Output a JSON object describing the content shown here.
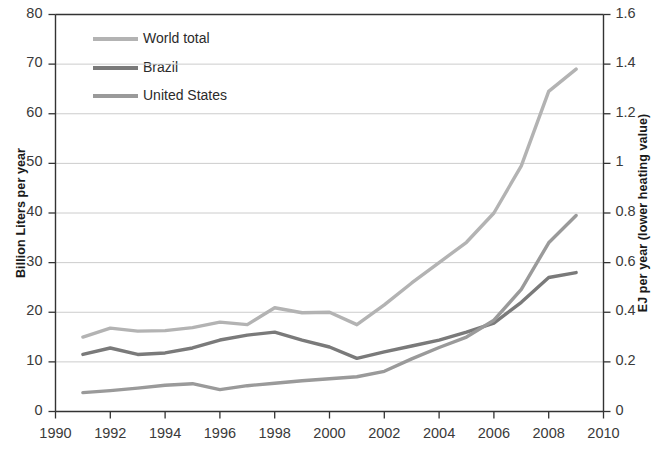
{
  "chart_data": {
    "type": "line",
    "title": "",
    "xlabel": "",
    "ylabel": "Billion Liters per year",
    "y2label": "EJ per year (lower heating value)",
    "x": [
      1991,
      1992,
      1993,
      1994,
      1995,
      1996,
      1997,
      1998,
      1999,
      2000,
      2001,
      2002,
      2003,
      2004,
      2005,
      2006,
      2007,
      2008,
      2009
    ],
    "xlim": [
      1990,
      2010
    ],
    "ylim": [
      0,
      80
    ],
    "y2lim": [
      0,
      1.6
    ],
    "xticks": [
      1990,
      1992,
      1994,
      1996,
      1998,
      2000,
      2002,
      2004,
      2006,
      2008,
      2010
    ],
    "yticks": [
      0,
      10,
      20,
      30,
      40,
      50,
      60,
      70,
      80
    ],
    "y2ticks": [
      0,
      0.2,
      0.4,
      0.6,
      0.8,
      1,
      1.2,
      1.4,
      1.6
    ],
    "xtick_labels": [
      "1990",
      "1992",
      "1994",
      "1996",
      "1998",
      "2000",
      "2002",
      "2004",
      "2006",
      "2008",
      "2010"
    ],
    "ytick_labels": [
      "0",
      "10",
      "20",
      "30",
      "40",
      "50",
      "60",
      "70",
      "80"
    ],
    "y2tick_labels": [
      "0",
      "0.2",
      "0.4",
      "0.6",
      "0.8",
      "1",
      "1.2",
      "1.4",
      "1.6"
    ],
    "grid": true,
    "grid_axis": "y",
    "legend_position": "top-left",
    "series": [
      {
        "name": "World total",
        "color": "#b3b3b3",
        "values": [
          15.0,
          16.8,
          16.2,
          16.3,
          16.9,
          18.0,
          17.5,
          20.9,
          19.9,
          20.0,
          17.5,
          21.5,
          25.9,
          30.0,
          34.1,
          40.0,
          49.5,
          64.5,
          69.0
        ]
      },
      {
        "name": "Brazil",
        "color": "#7a7a7a",
        "values": [
          11.5,
          12.8,
          11.5,
          11.8,
          12.8,
          14.4,
          15.4,
          16.0,
          14.4,
          13.0,
          10.7,
          12.0,
          13.2,
          14.4,
          16.0,
          17.8,
          22.0,
          27.0,
          28.0
        ]
      },
      {
        "name": "United States",
        "color": "#9a9a9a",
        "values": [
          3.8,
          4.2,
          4.7,
          5.3,
          5.6,
          4.4,
          5.2,
          5.7,
          6.2,
          6.6,
          7.0,
          8.1,
          10.6,
          12.9,
          15.0,
          18.4,
          24.6,
          34.0,
          39.5
        ]
      }
    ],
    "colors": {
      "world_total": "#b3b3b3",
      "brazil": "#7a7a7a",
      "united_states": "#9a9a9a",
      "axis": "#333333",
      "grid": "#cccccc",
      "background": "#ffffff",
      "text": "#2b2b2b"
    },
    "legend": [
      {
        "label": "World total",
        "color": "#b3b3b3"
      },
      {
        "label": "Brazil",
        "color": "#7a7a7a"
      },
      {
        "label": "United States",
        "color": "#9a9a9a"
      }
    ]
  }
}
